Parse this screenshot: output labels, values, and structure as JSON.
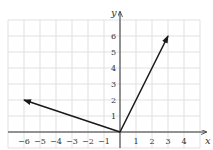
{
  "chart_data": {
    "type": "vector-plot",
    "title": "",
    "xlabel": "x",
    "ylabel": "y",
    "xlim": [
      -7,
      5
    ],
    "ylim": [
      -1,
      7
    ],
    "grid": true,
    "x_ticks": [
      -6,
      -5,
      -4,
      -3,
      -2,
      -1,
      1,
      2,
      3,
      4
    ],
    "x_tick_labels": [
      "−6",
      "−5",
      "−4",
      "−3",
      "−2",
      "−1",
      "1",
      "2",
      "3",
      "4"
    ],
    "y_ticks": [
      1,
      2,
      3,
      4,
      5,
      6
    ],
    "y_tick_labels": [
      "1",
      "2",
      "3",
      "4",
      "5",
      "6"
    ],
    "vectors": [
      {
        "name": "u",
        "from": [
          0,
          0
        ],
        "to": [
          3,
          6
        ]
      },
      {
        "name": "v",
        "from": [
          0,
          0
        ],
        "to": [
          -6,
          2
        ]
      }
    ],
    "colors": {
      "grid": "#d9d9d9",
      "axis": "#333333",
      "vector": "#1a1a1a",
      "text": "#333333"
    }
  }
}
